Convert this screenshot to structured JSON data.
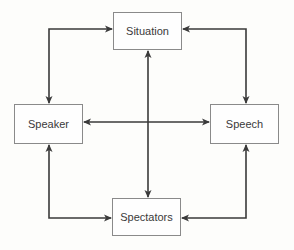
{
  "diagram": {
    "type": "relationship-diagram",
    "line_color": "#3a3a3a",
    "box_border_color": "#8a8a8a",
    "nodes": [
      {
        "id": "situation",
        "label": "Situation"
      },
      {
        "id": "speaker",
        "label": "Speaker"
      },
      {
        "id": "speech",
        "label": "Speech"
      },
      {
        "id": "spectators",
        "label": "Spectators"
      }
    ],
    "edges": [
      {
        "from": "situation",
        "to": "speaker",
        "bidirectional": true
      },
      {
        "from": "situation",
        "to": "speech",
        "bidirectional": true
      },
      {
        "from": "speaker",
        "to": "spectators",
        "bidirectional": true
      },
      {
        "from": "speech",
        "to": "spectators",
        "bidirectional": true
      },
      {
        "from": "speaker",
        "to": "speech",
        "bidirectional": true
      },
      {
        "from": "situation",
        "to": "spectators",
        "bidirectional": true
      }
    ]
  }
}
